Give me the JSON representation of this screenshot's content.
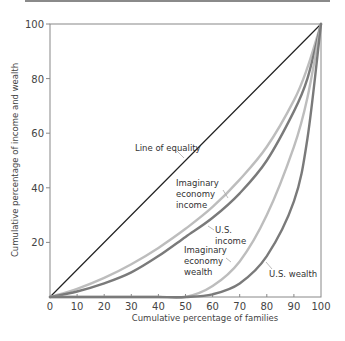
{
  "chart_data": {
    "type": "line",
    "title": "",
    "xlabel": "Cumulative percentage of families",
    "ylabel": "Cumulative percentage of income and wealth",
    "xlim": [
      0,
      100
    ],
    "ylim": [
      0,
      100
    ],
    "x_ticks": [
      0,
      10,
      20,
      30,
      40,
      50,
      60,
      70,
      80,
      90,
      100
    ],
    "y_ticks": [
      20,
      40,
      60,
      80,
      100
    ],
    "y_tick_labels": [
      "20",
      "40",
      "60",
      "80",
      "100"
    ],
    "x_tick_labels": [
      "0",
      "10",
      "20",
      "30",
      "40",
      "50",
      "60",
      "70",
      "80",
      "90",
      "100"
    ],
    "grid": false,
    "legend": "inline annotations",
    "x": [
      0,
      10,
      20,
      30,
      40,
      50,
      60,
      70,
      80,
      90,
      95,
      100
    ],
    "series": [
      {
        "name": "Line of equality",
        "color": "#222222",
        "values": [
          0,
          10,
          20,
          30,
          40,
          50,
          60,
          70,
          80,
          90,
          95,
          100
        ]
      },
      {
        "name": "Imaginary economy income",
        "color": "#bdbdbd",
        "values": [
          0,
          3,
          7,
          12,
          18,
          25,
          33,
          43,
          55,
          72,
          84,
          100
        ]
      },
      {
        "name": "U.S. income",
        "color": "#7a7a7a",
        "values": [
          0,
          2,
          5,
          9,
          15,
          22,
          29,
          38,
          50,
          68,
          80,
          100
        ]
      },
      {
        "name": "Imaginary economy wealth",
        "color": "#bdbdbd",
        "values": [
          0,
          0,
          0,
          0,
          0,
          0,
          4,
          13,
          30,
          55,
          73,
          100
        ]
      },
      {
        "name": "U.S. wealth",
        "color": "#7a7a7a",
        "values": [
          0,
          0,
          0,
          0,
          0,
          0,
          1,
          5,
          15,
          35,
          58,
          100
        ]
      }
    ],
    "annotations": [
      {
        "text": "Line of equality",
        "series": "Line of equality"
      },
      {
        "text": "Imaginary economy income",
        "series": "Imaginary economy income"
      },
      {
        "text": "U.S. income",
        "series": "U.S. income"
      },
      {
        "text": "Imaginary economy wealth",
        "series": "Imaginary economy wealth"
      },
      {
        "text": "U.S. wealth",
        "series": "U.S. wealth"
      }
    ]
  },
  "labels": {
    "xlabel": "Cumulative percentage of families",
    "ylabel": "Cumulative percentage of income and wealth",
    "line_of_equality": "Line of equality",
    "imag_income": [
      "Imaginary",
      "economy",
      "income"
    ],
    "us_income": [
      "U.S.",
      "income"
    ],
    "imag_wealth": [
      "Imaginary",
      "economy",
      "wealth"
    ],
    "us_wealth": "U.S. wealth"
  }
}
